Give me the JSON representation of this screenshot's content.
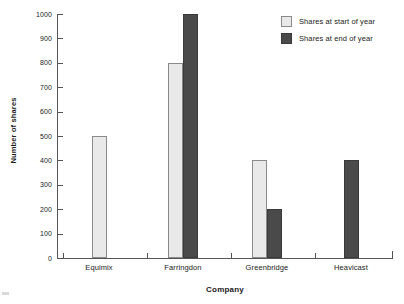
{
  "chart_data": {
    "type": "bar",
    "title": "",
    "xlabel": "Company",
    "ylabel": "Number of shares",
    "categories": [
      "Equimix",
      "Farringdon",
      "Greenbridge",
      "Heavicast"
    ],
    "series": [
      {
        "name": "Shares at start of year",
        "color": "#e9e9e9",
        "values": [
          500,
          800,
          400,
          0
        ]
      },
      {
        "name": "Shares at end of year",
        "color": "#4a4a4a",
        "values": [
          0,
          1000,
          200,
          400
        ]
      }
    ],
    "ylim": [
      0,
      1000
    ],
    "yticks": [
      0,
      100,
      200,
      300,
      400,
      500,
      600,
      700,
      800,
      900,
      1000
    ],
    "ytick_labels": [
      "0",
      "100",
      "200",
      "300",
      "400",
      "500",
      "600",
      "700",
      "800",
      "900",
      "1000"
    ],
    "grid": false,
    "legend_position": "top-right"
  },
  "legend": {
    "items": [
      {
        "label": "Shares at start of year",
        "swatch": "light-gray-swatch"
      },
      {
        "label": "Shares at end of year",
        "swatch": "dark-gray-swatch"
      }
    ]
  }
}
